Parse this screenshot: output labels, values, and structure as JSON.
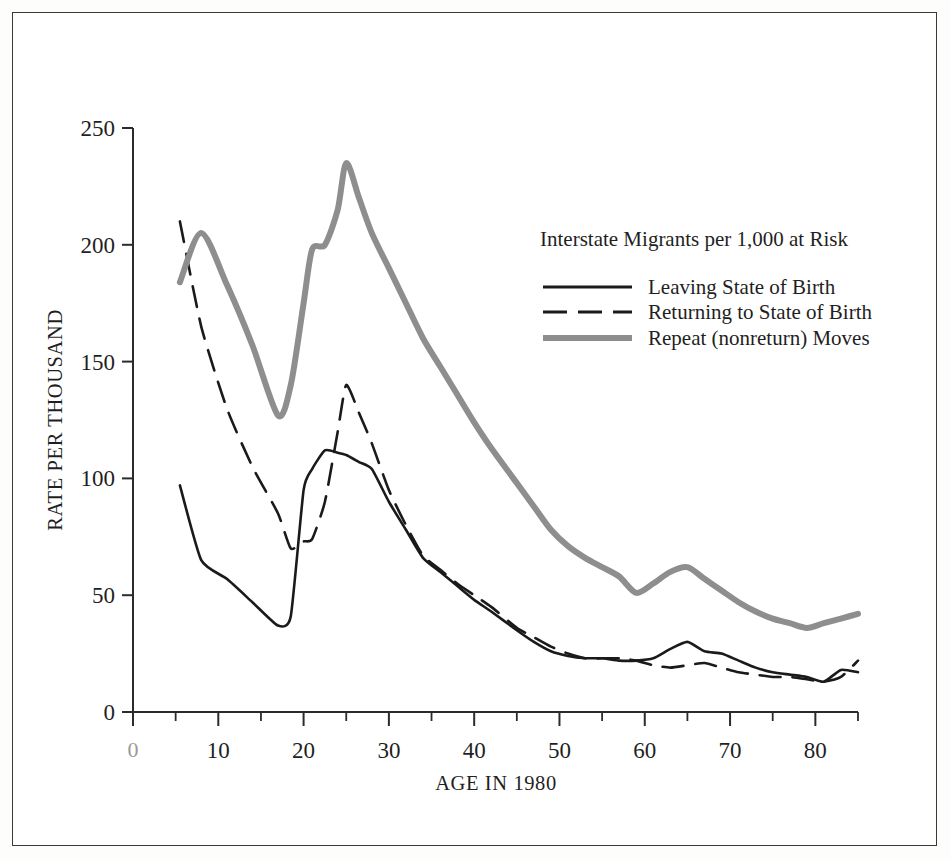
{
  "chart_data": {
    "type": "line",
    "title": "",
    "xlabel": "AGE IN 1980",
    "ylabel": "RATE PER THOUSAND",
    "legend_title": "Interstate Migrants per 1,000 at Risk",
    "legend_position": "upper-right-inside",
    "grid": false,
    "xlim": [
      0,
      85
    ],
    "ylim": [
      0,
      250
    ],
    "xticks": [
      0,
      10,
      20,
      30,
      40,
      50,
      60,
      70,
      80
    ],
    "xticklabels": [
      "0",
      "10",
      "20",
      "30",
      "40",
      "50",
      "60",
      "70",
      "80"
    ],
    "xminorticks": [
      5,
      15,
      25,
      35,
      45,
      55,
      65,
      75,
      85
    ],
    "yticks": [
      0,
      50,
      100,
      150,
      200,
      250
    ],
    "yticklabels": [
      "0",
      "50",
      "100",
      "150",
      "200",
      "250"
    ],
    "x": [
      5.5,
      8,
      11,
      14,
      17,
      18.5,
      20,
      21,
      22.5,
      24,
      25,
      26.5,
      28,
      30,
      32,
      34,
      36,
      38,
      40,
      42,
      45,
      47,
      49,
      51,
      53,
      55,
      57,
      59,
      61,
      63,
      65,
      67,
      69,
      71,
      73,
      75,
      77,
      79,
      81,
      83,
      85
    ],
    "series": [
      {
        "name": "Leaving State of Birth",
        "style": "solid",
        "color": "#1a1a1a",
        "width": 2.6,
        "values": [
          97,
          65,
          57,
          47,
          37,
          41,
          95,
          104,
          112,
          111,
          110,
          107,
          104,
          90,
          78,
          66,
          60,
          54,
          48,
          43,
          35,
          30,
          26,
          24,
          23,
          23,
          22,
          22,
          23,
          27,
          30,
          26,
          25,
          22,
          19,
          17,
          16,
          15,
          13,
          18,
          17
        ]
      },
      {
        "name": "Returning to State of Birth",
        "style": "dashed",
        "color": "#1a1a1a",
        "width": 2.6,
        "values": [
          210,
          165,
          130,
          105,
          85,
          70,
          73,
          74,
          90,
          120,
          140,
          128,
          115,
          95,
          80,
          67,
          61,
          55,
          50,
          45,
          36,
          32,
          28,
          25,
          23,
          23,
          23,
          22,
          20,
          19,
          20,
          21,
          19,
          17,
          16,
          15,
          15,
          14,
          13,
          15,
          22
        ]
      },
      {
        "name": "Repeat (nonreturn) Moves",
        "style": "solid",
        "color": "#8e8e8e",
        "width": 6.0,
        "values": [
          184,
          205,
          183,
          157,
          127,
          140,
          175,
          198,
          200,
          215,
          235,
          220,
          205,
          190,
          175,
          160,
          148,
          136,
          124,
          113,
          98,
          88,
          78,
          71,
          66,
          62,
          58,
          51,
          55,
          60,
          62,
          57,
          52,
          47,
          43,
          40,
          38,
          36,
          38,
          40,
          42
        ]
      }
    ]
  },
  "figure": {
    "legend_title": "Interstate Migrants per 1,000 at Risk",
    "legend_items": [
      {
        "label": "Leaving State of Birth",
        "swatch": "solid-black-line"
      },
      {
        "label": "Returning to State of Birth",
        "swatch": "dashed-black-line"
      },
      {
        "label": "Repeat (nonreturn) Moves",
        "swatch": "solid-gray-line"
      }
    ],
    "y_axis_title": "RATE PER THOUSAND",
    "x_axis_title": "AGE IN 1980",
    "origin_label": "0"
  }
}
